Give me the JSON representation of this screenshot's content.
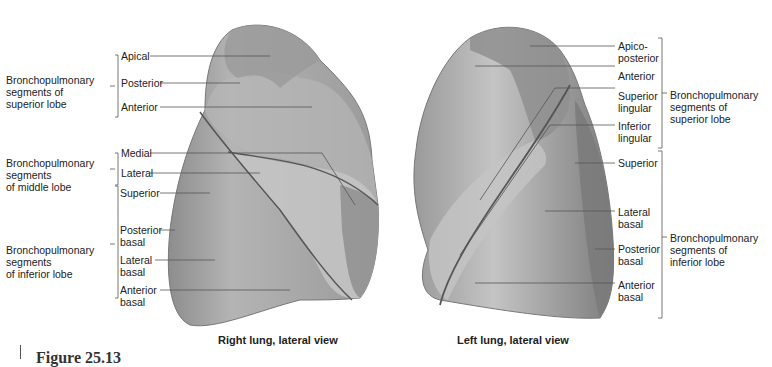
{
  "figure": {
    "caption_partial": "Figure 25.13"
  },
  "right_lung": {
    "caption": "Right lung, lateral view",
    "groups": {
      "superior": [
        "Bronchopulmonary",
        "segments of",
        "superior lobe"
      ],
      "middle": [
        "Bronchopulmonary",
        "segments",
        "of middle lobe"
      ],
      "inferior": [
        "Bronchopulmonary",
        "segments",
        "of inferior lobe"
      ]
    },
    "labels": {
      "apical": "Apical",
      "posterior": "Posterior",
      "anterior": "Anterior",
      "medial": "Medial",
      "lateral": "Lateral",
      "superior": "Superior",
      "posterior_basal": [
        "Posterior",
        "basal"
      ],
      "lateral_basal": [
        "Lateral",
        "basal"
      ],
      "anterior_basal": [
        "Anterior",
        "basal"
      ]
    }
  },
  "left_lung": {
    "caption": "Left lung, lateral view",
    "groups": {
      "superior": [
        "Bronchopulmonary",
        "segments of",
        "superior lobe"
      ],
      "inferior": [
        "Bronchopulmonary",
        "segments of",
        "inferior lobe"
      ]
    },
    "labels": {
      "apicoposterior": [
        "Apico-",
        "posterior"
      ],
      "anterior": "Anterior",
      "superior_lingular": [
        "Superior",
        "lingular"
      ],
      "inferior_lingular": [
        "Inferior",
        "lingular"
      ],
      "superior": "Superior",
      "lateral_basal": [
        "Lateral",
        "basal"
      ],
      "posterior_basal": [
        "Posterior",
        "basal"
      ],
      "anterior_basal": [
        "Anterior",
        "basal"
      ]
    }
  },
  "colors": {
    "lung_dark": "#8a8a8a",
    "lung_mid": "#a8a8a8",
    "lung_light": "#c8c8c8",
    "line": "#555555"
  }
}
